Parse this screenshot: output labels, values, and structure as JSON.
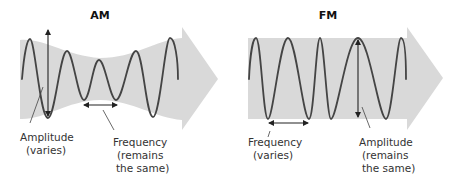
{
  "am": {
    "title": "AM",
    "amplitude_label": {
      "line1": "Amplitude",
      "line2": "(varies)"
    },
    "frequency_label": {
      "line1": "Frequency",
      "line2": "(remains",
      "line3": "the same)"
    }
  },
  "fm": {
    "title": "FM",
    "frequency_label": {
      "line1": "Frequency",
      "line2": "(varies)"
    },
    "amplitude_label": {
      "line1": "Amplitude",
      "line2": "(remains",
      "line3": "the same)"
    }
  },
  "colors": {
    "band": "#d9d9d9",
    "wave": "#444444",
    "text": "#333333"
  }
}
